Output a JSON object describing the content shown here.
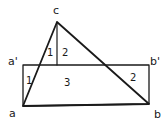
{
  "diagram": {
    "colors": {
      "line": "#1a1a1a",
      "background": "#ffffff"
    },
    "points": {
      "c": {
        "label": "c"
      },
      "a_prime": {
        "label": "a'"
      },
      "b_prime": {
        "label": "b'"
      },
      "a": {
        "label": "a"
      },
      "b": {
        "label": "b"
      }
    },
    "regions": {
      "triangle_left": {
        "label": "1"
      },
      "triangle_right": {
        "label": "2"
      },
      "rect_left": {
        "label": "1"
      },
      "rect_center": {
        "label": "3"
      },
      "rect_right": {
        "label": "2"
      }
    }
  }
}
